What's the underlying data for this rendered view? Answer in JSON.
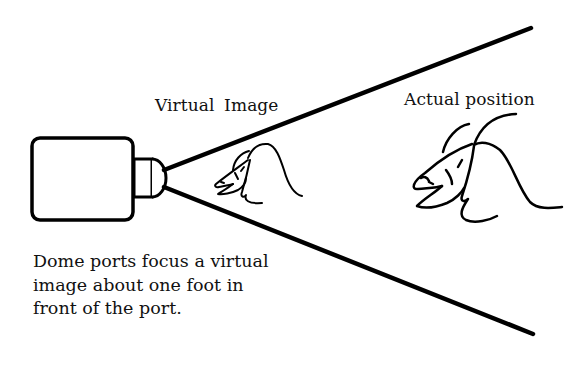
{
  "labels": {
    "virtual_image": "Virtual  Image",
    "actual_position": "Actual position"
  },
  "caption": {
    "lines": [
      "Dome ports focus a virtual",
      "image about one foot in",
      "front of the port."
    ]
  },
  "elements": {
    "camera": "camera-housing",
    "port": "dome-port",
    "rays": [
      "upper-field-of-view-line",
      "lower-field-of-view-line"
    ],
    "fish_figures": [
      "virtual-image-fish",
      "actual-position-fish"
    ]
  },
  "colors": {
    "background": "#ffffff",
    "ink": "#000000"
  }
}
